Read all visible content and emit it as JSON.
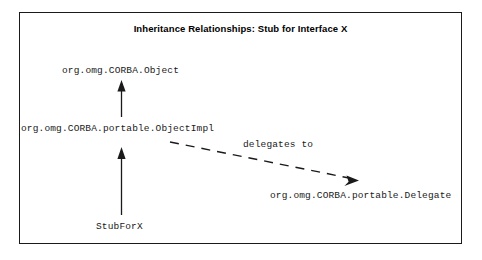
{
  "figure": {
    "title": "Inheritance Relationships: Stub for Interface X",
    "border_color": "#1a1a1a",
    "background_color": "#ffffff",
    "text_color": "#1a1a1a"
  },
  "diagram": {
    "type": "class-inheritance-diagram",
    "nodes": [
      {
        "id": "corba-object",
        "label": "org.omg.CORBA.Object"
      },
      {
        "id": "object-impl",
        "label": "org.omg.CORBA.portable.ObjectImpl"
      },
      {
        "id": "delegate",
        "label": "org.omg.CORBA.portable.Delegate"
      },
      {
        "id": "stub-for-x",
        "label": "StubForX"
      }
    ],
    "edges": [
      {
        "id": "impl-extends-object",
        "from": "object-impl",
        "to": "corba-object",
        "style": "solid",
        "arrowhead": "filled",
        "label": ""
      },
      {
        "id": "stub-extends-impl",
        "from": "stub-for-x",
        "to": "object-impl",
        "style": "solid",
        "arrowhead": "filled",
        "label": ""
      },
      {
        "id": "impl-delegates-to-delegate",
        "from": "object-impl",
        "to": "delegate",
        "style": "dashed",
        "arrowhead": "filled",
        "label": "delegates to"
      }
    ]
  }
}
